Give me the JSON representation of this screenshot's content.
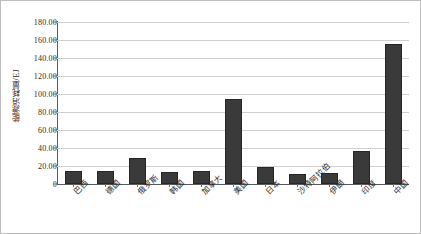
{
  "chart_data": {
    "type": "bar",
    "title": "",
    "xlabel": "",
    "ylabel": "能源消耗量/EJ",
    "ylim": [
      0,
      180
    ],
    "ytick_step": 20,
    "grid": true,
    "legend": false,
    "bar_color": "#3a3a3a",
    "categories": [
      "巴西",
      "德国",
      "俄罗斯",
      "韩国",
      "加拿大",
      "美国",
      "日本",
      "沙特阿拉伯",
      "伊朗",
      "印度",
      "中国"
    ],
    "values": [
      14,
      15,
      29,
      13,
      14,
      95,
      19,
      11,
      12,
      37,
      156
    ],
    "ytick_labels": [
      "180.00",
      "160.00",
      "140.00",
      "120.00",
      "100.00",
      "80.00",
      "60.00",
      "40.00",
      "20.00",
      "0"
    ],
    "ytick_values": [
      180,
      160,
      140,
      120,
      100,
      80,
      60,
      40,
      20,
      0
    ]
  }
}
